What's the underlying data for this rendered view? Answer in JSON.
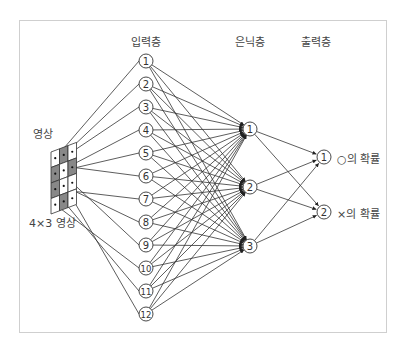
{
  "headers": {
    "input": "입력층",
    "hidden": "은닉층",
    "output": "출력층"
  },
  "image": {
    "title": "영상",
    "caption": "4×3 영상",
    "rows": 4,
    "cols": 3,
    "cells": [
      [
        0,
        1,
        0
      ],
      [
        1,
        0,
        1
      ],
      [
        1,
        0,
        0
      ],
      [
        0,
        1,
        0
      ]
    ],
    "gray_color": "#888888"
  },
  "input_nodes": [
    "1",
    "2",
    "3",
    "4",
    "5",
    "6",
    "7",
    "8",
    "9",
    "10",
    "11",
    "12"
  ],
  "hidden_nodes": [
    "1",
    "2",
    "3"
  ],
  "output_nodes": [
    {
      "id": "1",
      "label": "○의 확률"
    },
    {
      "id": "2",
      "label": "×의 확률"
    }
  ],
  "figure_caption": ""
}
